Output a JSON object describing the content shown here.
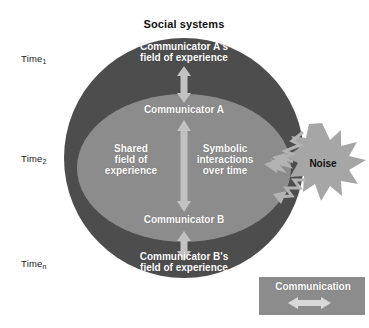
{
  "diagram": {
    "title": "Social systems",
    "time_axis": [
      {
        "base": "Time",
        "sub": "1"
      },
      {
        "base": "Time",
        "sub": "2"
      },
      {
        "base": "Time",
        "sub": "n"
      }
    ],
    "outer_circle": {
      "name": "social-systems-circle",
      "color": "#4d4d4d",
      "labels": {
        "top": "Communicator A's\nfield of experience",
        "bottom": "Communicator B's\nfield of experience"
      }
    },
    "inner_ellipse": {
      "name": "shared-field-ellipse",
      "color": "#8c8c8c",
      "labels": {
        "top": "Communicator A",
        "left": "Shared\nfield of\nexperience",
        "right": "Symbolic\ninteractions\nover time",
        "bottom": "Communicator B"
      }
    },
    "arrows": {
      "color": "#bfbfbf",
      "items": [
        {
          "name": "arrow-a-field-to-a",
          "direction": "vertical-double"
        },
        {
          "name": "arrow-a-to-b",
          "direction": "vertical-double"
        },
        {
          "name": "arrow-b-to-b-field",
          "direction": "vertical-double"
        }
      ]
    },
    "noise": {
      "label": "Noise",
      "shape": "starburst",
      "color": "#a6a6a6",
      "bolt_color": "#b3b3b3",
      "bolt_count": 3
    },
    "legend": {
      "label": "Communication",
      "box_color": "#8c8c8c",
      "arrow_color": "#d9d9d9",
      "arrow_direction": "horizontal-double"
    }
  }
}
